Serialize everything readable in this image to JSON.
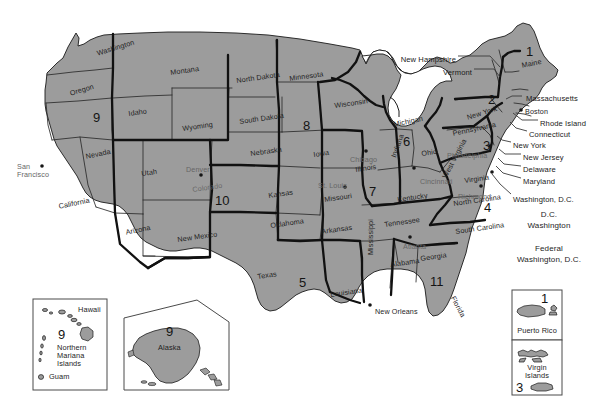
{
  "colors": {
    "land_fill": "#9c9c9c",
    "land_stroke": "#1a1a1a",
    "circuit_boundary": "#111111",
    "state_boundary": "#2b2b2b",
    "background": "#ffffff",
    "label_dark": "#1e1e1e",
    "label_light": "#6a6a6a"
  },
  "states": [
    {
      "name": "Washington",
      "x": 96,
      "y": 50,
      "rot": "rot-18",
      "tone": "dark"
    },
    {
      "name": "Oregon",
      "x": 69,
      "y": 90,
      "rot": "rot-18",
      "tone": "dark"
    },
    {
      "name": "Idaho",
      "x": 128,
      "y": 110,
      "rot": "rot-8",
      "tone": "dark"
    },
    {
      "name": "Montana",
      "x": 170,
      "y": 69,
      "rot": "rot-8",
      "tone": "dark"
    },
    {
      "name": "Wyoming",
      "x": 182,
      "y": 125,
      "rot": "rot-8",
      "tone": "dark"
    },
    {
      "name": "Nevada",
      "x": 85,
      "y": 153,
      "rot": "rot-12",
      "tone": "dark"
    },
    {
      "name": "Utah",
      "x": 141,
      "y": 170,
      "rot": "rot-8",
      "tone": "dark"
    },
    {
      "name": "Colorado",
      "x": 192,
      "y": 186,
      "rot": "rot-8",
      "tone": "light"
    },
    {
      "name": "California",
      "x": 58,
      "y": 203,
      "rot": "rot-12",
      "tone": "dark"
    },
    {
      "name": "Arizona",
      "x": 125,
      "y": 229,
      "rot": "rot-12",
      "tone": "dark"
    },
    {
      "name": "New Mexico",
      "x": 177,
      "y": 236,
      "rot": "rot-8",
      "tone": "dark"
    },
    {
      "name": "North Dakota",
      "x": 236,
      "y": 77,
      "rot": "rot-8",
      "tone": "dark"
    },
    {
      "name": "South Dakota",
      "x": 239,
      "y": 118,
      "rot": "rot-8",
      "tone": "dark"
    },
    {
      "name": "Nebraska",
      "x": 250,
      "y": 150,
      "rot": "rot-8",
      "tone": "dark"
    },
    {
      "name": "Kansas",
      "x": 268,
      "y": 192,
      "rot": "rot-8",
      "tone": "dark"
    },
    {
      "name": "Oklahoma",
      "x": 270,
      "y": 222,
      "rot": "rot-8",
      "tone": "dark"
    },
    {
      "name": "Texas",
      "x": 257,
      "y": 273,
      "rot": "rot-8",
      "tone": "dark"
    },
    {
      "name": "Minnesota",
      "x": 289,
      "y": 75,
      "rot": "rot-8",
      "tone": "dark"
    },
    {
      "name": "Iowa",
      "x": 313,
      "y": 151,
      "rot": "rot-8",
      "tone": "dark"
    },
    {
      "name": "Missouri",
      "x": 324,
      "y": 196,
      "rot": "rot-8",
      "tone": "dark"
    },
    {
      "name": "Arkansas",
      "x": 321,
      "y": 228,
      "rot": "rot-8",
      "tone": "dark"
    },
    {
      "name": "Louisiana",
      "x": 330,
      "y": 291,
      "rot": "rot-8",
      "tone": "dark"
    },
    {
      "name": "Wisconsin",
      "x": 334,
      "y": 102,
      "rot": "rot-8",
      "tone": "dark"
    },
    {
      "name": "Illinois",
      "x": 355,
      "y": 166,
      "rot": "rot-8",
      "tone": "dark"
    },
    {
      "name": "Michigan",
      "x": 393,
      "y": 121,
      "rot": "rot-12",
      "tone": "dark"
    },
    {
      "name": "Indiana",
      "x": 390,
      "y": 156,
      "rot": "rot-70",
      "tone": "dark"
    },
    {
      "name": "Ohio",
      "x": 421,
      "y": 150,
      "rot": "rot-8",
      "tone": "dark"
    },
    {
      "name": "Kentucky",
      "x": 397,
      "y": 196,
      "rot": "rot-8",
      "tone": "dark"
    },
    {
      "name": "Tennessee",
      "x": 384,
      "y": 221,
      "rot": "rot-8",
      "tone": "dark"
    },
    {
      "name": "Mississippi",
      "x": 367,
      "y": 255,
      "rot": "rot-90",
      "tone": "dark"
    },
    {
      "name": "Alabama",
      "x": 390,
      "y": 261,
      "rot": "rot-8",
      "tone": "dark"
    },
    {
      "name": "Georgia",
      "x": 420,
      "y": 255,
      "rot": "rot-8",
      "tone": "dark"
    },
    {
      "name": "Florida",
      "x": 456,
      "y": 295,
      "rot": "rotp62",
      "tone": "dark"
    },
    {
      "name": "West Virginia",
      "x": 441,
      "y": 176,
      "rot": "rot-62",
      "tone": "dark"
    },
    {
      "name": "Virginia",
      "x": 464,
      "y": 177,
      "rot": "rot-8",
      "tone": "dark"
    },
    {
      "name": "North Carolina",
      "x": 453,
      "y": 200,
      "rot": "rot-8",
      "tone": "dark"
    },
    {
      "name": "South Carolina",
      "x": 455,
      "y": 228,
      "rot": "rot-8",
      "tone": "dark"
    },
    {
      "name": "Pennsylvania",
      "x": 452,
      "y": 130,
      "rot": "rot-12",
      "tone": "dark"
    },
    {
      "name": "New York",
      "x": 466,
      "y": 114,
      "rot": "rot-18",
      "tone": "dark"
    },
    {
      "name": "Maine",
      "x": 521,
      "y": 62,
      "rot": "rot-12",
      "tone": "dark"
    }
  ],
  "cities": [
    {
      "name": "San\nFrancisco",
      "x": 17,
      "y": 163,
      "tone": "light",
      "dot": {
        "x": 42,
        "y": 166
      }
    },
    {
      "name": "Denver",
      "x": 186,
      "y": 166,
      "tone": "light",
      "dot": {
        "x": 201,
        "y": 175
      }
    },
    {
      "name": "Chicago",
      "x": 350,
      "y": 156,
      "tone": "light",
      "dot": {
        "x": 366,
        "y": 151
      }
    },
    {
      "name": "St. Louis",
      "x": 318,
      "y": 182,
      "tone": "light",
      "dot": {
        "x": 345,
        "y": 187
      }
    },
    {
      "name": "Cincinnati",
      "x": 420,
      "y": 178,
      "tone": "light",
      "dot": {
        "x": 414,
        "y": 168
      }
    },
    {
      "name": "Philadelphia",
      "x": 447,
      "y": 152,
      "tone": "light",
      "dot": {
        "x": 490,
        "y": 146
      }
    },
    {
      "name": "Richmond",
      "x": 458,
      "y": 193,
      "tone": "light",
      "dot": {
        "x": 481,
        "y": 186
      }
    },
    {
      "name": "Boston",
      "x": 525,
      "y": 108,
      "tone": "dark",
      "dot": {
        "x": 521,
        "y": 110
      }
    },
    {
      "name": "Atlanta",
      "x": 403,
      "y": 243,
      "tone": "light",
      "dot": {
        "x": 410,
        "y": 237
      }
    },
    {
      "name": "New Orleans",
      "x": 375,
      "y": 308,
      "tone": "dark",
      "dot": {
        "x": 370,
        "y": 305
      }
    }
  ],
  "circuits": [
    {
      "number": "1",
      "x": 526,
      "y": 45
    },
    {
      "number": "2",
      "x": 488,
      "y": 93
    },
    {
      "number": "3",
      "x": 483,
      "y": 139
    },
    {
      "number": "4",
      "x": 484,
      "y": 201
    },
    {
      "number": "5",
      "x": 299,
      "y": 276
    },
    {
      "number": "6",
      "x": 403,
      "y": 135
    },
    {
      "number": "7",
      "x": 369,
      "y": 185
    },
    {
      "number": "8",
      "x": 303,
      "y": 119
    },
    {
      "number": "9",
      "x": 93,
      "y": 111
    },
    {
      "number": "10",
      "x": 215,
      "y": 194
    },
    {
      "number": "11",
      "x": 430,
      "y": 275
    }
  ],
  "leader_labels": [
    {
      "label": "New Hampshire",
      "x": 456,
      "y": 56,
      "anchor": "end"
    },
    {
      "label": "Vermont",
      "x": 472,
      "y": 69,
      "anchor": "end"
    },
    {
      "label": "Massachusetts",
      "x": 526,
      "y": 95,
      "anchor": "start"
    },
    {
      "label": "Rhode Island",
      "x": 540,
      "y": 120,
      "anchor": "start"
    },
    {
      "label": "Connecticut",
      "x": 529,
      "y": 131,
      "anchor": "start"
    },
    {
      "label": "New York",
      "x": 513,
      "y": 142,
      "anchor": "start"
    },
    {
      "label": "New Jersey",
      "x": 523,
      "y": 154,
      "anchor": "start"
    },
    {
      "label": "Delaware",
      "x": 523,
      "y": 166,
      "anchor": "start"
    },
    {
      "label": "Maryland",
      "x": 523,
      "y": 178,
      "anchor": "start"
    },
    {
      "label": "Washington, D.C.",
      "x": 513,
      "y": 196,
      "anchor": "start"
    }
  ],
  "district_boxes": [
    {
      "line1": "D.C.",
      "line2": "Washington",
      "x": 516,
      "y": 205,
      "w": 66,
      "h": 30
    },
    {
      "line1": "Federal",
      "line2": "Washington, D.C.",
      "x": 516,
      "y": 239,
      "w": 66,
      "h": 30
    }
  ],
  "insets": [
    {
      "name": "hawaii-pacific-inset",
      "x": 33,
      "y": 299,
      "w": 74,
      "h": 91,
      "circuit": "9",
      "labels": [
        {
          "text": "Hawaii",
          "x": 48,
          "y": 8
        },
        {
          "text": "Northern",
          "x": 26,
          "y": 47
        },
        {
          "text": "Mariana",
          "x": 26,
          "y": 55
        },
        {
          "text": "Islands",
          "x": 26,
          "y": 63
        },
        {
          "text": "Guam",
          "x": 26,
          "y": 77
        }
      ],
      "circuit_pos": {
        "x": 27,
        "y": 33
      }
    },
    {
      "name": "alaska-inset",
      "x": 124,
      "y": 300,
      "w": 105,
      "h": 90,
      "circuit": "9",
      "labels": [
        {
          "text": "Alaska",
          "x": 47,
          "y": 45
        }
      ],
      "circuit_pos": {
        "x": 50,
        "y": 27
      }
    }
  ],
  "territory_boxes": [
    {
      "name": "puerto-rico-box",
      "label": "Puerto Rico",
      "circuit": "1",
      "x": 512,
      "y": 290,
      "w": 50,
      "h": 50
    },
    {
      "name": "virgin-islands-box",
      "label": "Virgin\nIslands",
      "circuit": "3",
      "x": 512,
      "y": 340,
      "w": 50,
      "h": 55
    }
  ]
}
